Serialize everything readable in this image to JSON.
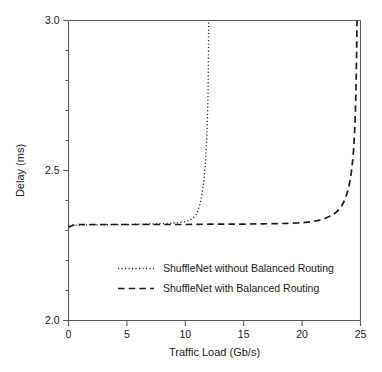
{
  "chart_data": {
    "type": "line",
    "title": "",
    "xlabel": "Traffic Load (Gb/s)",
    "ylabel": "Delay (ms)",
    "xlim": [
      0,
      25
    ],
    "ylim": [
      2.0,
      3.0
    ],
    "xticks": [
      0,
      5,
      10,
      15,
      20,
      25
    ],
    "xtick_labels": [
      "0",
      "5",
      "10",
      "15",
      "20",
      "25"
    ],
    "yticks": [
      2.0,
      2.5,
      3.0
    ],
    "ytick_labels": [
      "2.0",
      "2.5",
      "3.0"
    ],
    "yticks_minor": [
      2.1,
      2.2,
      2.3,
      2.4,
      2.6,
      2.7,
      2.8,
      2.9
    ],
    "xticks_minor": [],
    "grid": false,
    "legend_position": "lower center",
    "series": [
      {
        "name": "ShuffleNet without Balanced Routing",
        "style": "dotted",
        "color": "#1a1a1a",
        "x": [
          0.0,
          1.0,
          2.0,
          3.0,
          4.0,
          5.0,
          6.0,
          7.0,
          8.0,
          9.0,
          9.5,
          10.0,
          10.3,
          10.6,
          10.9,
          11.1,
          11.3,
          11.5,
          11.65,
          11.75,
          11.85,
          11.92,
          11.96,
          11.99,
          12.0
        ],
        "y": [
          2.318,
          2.318,
          2.319,
          2.319,
          2.32,
          2.32,
          2.321,
          2.322,
          2.323,
          2.325,
          2.327,
          2.33,
          2.334,
          2.34,
          2.352,
          2.368,
          2.395,
          2.44,
          2.49,
          2.545,
          2.625,
          2.71,
          2.8,
          2.92,
          3.0
        ]
      },
      {
        "name": "ShuffleNet with Balanced Routing",
        "style": "dashed",
        "color": "#1a1a1a",
        "x": [
          0.0,
          0.3,
          0.7,
          1.2,
          2.0,
          4.0,
          6.0,
          8.0,
          10.0,
          12.0,
          14.0,
          16.0,
          18.0,
          19.5,
          20.5,
          21.3,
          22.0,
          22.6,
          23.1,
          23.5,
          23.8,
          24.05,
          24.25,
          24.4,
          24.5,
          24.58,
          24.63,
          24.67,
          24.7
        ],
        "y": [
          2.31,
          2.316,
          2.319,
          2.32,
          2.32,
          2.32,
          2.32,
          2.32,
          2.32,
          2.321,
          2.321,
          2.322,
          2.323,
          2.325,
          2.328,
          2.333,
          2.341,
          2.352,
          2.368,
          2.39,
          2.418,
          2.455,
          2.505,
          2.565,
          2.635,
          2.72,
          2.805,
          2.905,
          3.0
        ]
      }
    ],
    "legend_entries": [
      {
        "label": "ShuffleNet without Balanced Routing",
        "style": "dotted"
      },
      {
        "label": "ShuffleNet with Balanced Routing",
        "style": "dashed"
      }
    ]
  }
}
